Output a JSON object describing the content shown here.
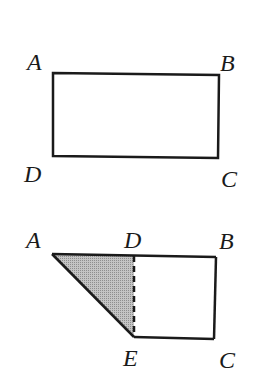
{
  "figures": [
    {
      "id": "rectangle",
      "labels": {
        "A": "A",
        "B": "B",
        "C": "C",
        "D": "D"
      }
    },
    {
      "id": "folded",
      "labels": {
        "A": "A",
        "D": "D",
        "B": "B",
        "E": "E",
        "C": "C"
      },
      "shaded_region": "triangle ADE",
      "dashed_segment": "DE"
    }
  ],
  "colors": {
    "stroke": "#1a1a1a",
    "shade": "#b4b4b4"
  }
}
